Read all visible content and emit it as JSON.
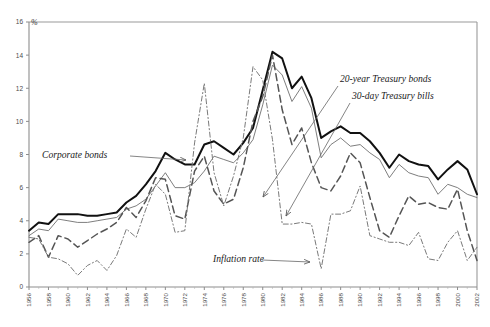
{
  "faint_header": "",
  "axis": {
    "y_unit_label": "%",
    "y_ticks": [
      0,
      2,
      4,
      6,
      8,
      10,
      12,
      14,
      16
    ],
    "x_ticks": [
      1956,
      1958,
      1960,
      1962,
      1964,
      1966,
      1968,
      1970,
      1972,
      1974,
      1976,
      1978,
      1980,
      1982,
      1984,
      1986,
      1988,
      1990,
      1992,
      1994,
      1996,
      1998,
      2000,
      2002
    ]
  },
  "annotations": [
    {
      "name": "corporate-bonds",
      "text": "Corporate bonds",
      "x": 42,
      "y": 158,
      "arrow_from": [
        130,
        156
      ],
      "arrow_to": [
        186,
        160
      ]
    },
    {
      "name": "treasury-bonds-20y",
      "text": "20-year Treasury bonds",
      "x": 340,
      "y": 82,
      "arrow_from": [
        338,
        86
      ],
      "arrow_to": [
        263,
        197
      ]
    },
    {
      "name": "treasury-bills-30d",
      "text": "30-day Treasury bills",
      "x": 352,
      "y": 99,
      "arrow_from": [
        350,
        103
      ],
      "arrow_to": [
        286,
        216
      ]
    },
    {
      "name": "inflation-rate",
      "text": "Inflation rate",
      "x": 213,
      "y": 262,
      "arrow_from": [
        262,
        260
      ],
      "arrow_to": [
        310,
        262
      ]
    }
  ],
  "colors": {
    "corporate_bonds": "#111111",
    "treasury_bonds_20y": "#6f6f6f",
    "treasury_bills_30d": "#555555",
    "inflation_rate": "#7a7a7a",
    "axis": "#9a9a9a",
    "text": "#1a1a1a"
  },
  "chart_data": {
    "type": "line",
    "title": "",
    "xlabel": "",
    "ylabel": "%",
    "xlim": [
      1956,
      2002
    ],
    "ylim": [
      0,
      16
    ],
    "grid": false,
    "legend_position": "inline-annotations",
    "x": [
      1956,
      1957,
      1958,
      1959,
      1960,
      1961,
      1962,
      1963,
      1964,
      1965,
      1966,
      1967,
      1968,
      1969,
      1970,
      1971,
      1972,
      1973,
      1974,
      1975,
      1976,
      1977,
      1978,
      1979,
      1980,
      1981,
      1982,
      1983,
      1984,
      1985,
      1986,
      1987,
      1988,
      1989,
      1990,
      1991,
      1992,
      1993,
      1994,
      1995,
      1996,
      1997,
      1998,
      1999,
      2000,
      2001,
      2002
    ],
    "series": [
      {
        "name": "Corporate bonds",
        "style": "thick-solid",
        "color": "#111111",
        "values": [
          3.4,
          3.9,
          3.8,
          4.4,
          4.4,
          4.4,
          4.3,
          4.3,
          4.4,
          4.5,
          5.1,
          5.5,
          6.2,
          7.0,
          8.1,
          7.7,
          7.4,
          7.4,
          8.6,
          8.8,
          8.4,
          8.0,
          8.7,
          9.6,
          11.9,
          14.2,
          13.8,
          12.0,
          12.7,
          11.4,
          9.0,
          9.4,
          9.7,
          9.3,
          9.3,
          8.8,
          8.1,
          7.2,
          8.0,
          7.6,
          7.4,
          7.3,
          6.5,
          7.1,
          7.6,
          7.1,
          5.6
        ]
      },
      {
        "name": "20-year Treasury bonds",
        "style": "thin-solid",
        "color": "#6f6f6f",
        "values": [
          3.1,
          3.5,
          3.4,
          4.1,
          4.0,
          3.9,
          3.9,
          4.0,
          4.1,
          4.2,
          4.7,
          4.9,
          5.3,
          6.1,
          6.9,
          6.0,
          6.0,
          6.3,
          7.0,
          7.9,
          7.7,
          7.5,
          8.1,
          8.9,
          11.0,
          13.4,
          12.8,
          11.2,
          12.1,
          10.8,
          7.8,
          8.6,
          9.0,
          8.5,
          8.6,
          8.1,
          7.7,
          6.6,
          7.4,
          6.9,
          6.7,
          6.6,
          5.6,
          6.2,
          6.0,
          5.6,
          5.4
        ]
      },
      {
        "name": "30-day Treasury bills",
        "style": "long-dash",
        "color": "#555555",
        "values": [
          2.7,
          3.1,
          1.8,
          3.1,
          2.9,
          2.4,
          2.8,
          3.2,
          3.5,
          3.9,
          4.8,
          4.2,
          5.2,
          6.6,
          6.5,
          4.3,
          4.1,
          7.0,
          7.9,
          5.8,
          5.0,
          5.3,
          7.2,
          10.0,
          11.5,
          14.0,
          10.7,
          8.6,
          9.6,
          7.5,
          6.0,
          5.8,
          6.7,
          8.1,
          7.5,
          5.4,
          3.4,
          3.0,
          4.3,
          5.5,
          5.0,
          5.1,
          4.8,
          4.7,
          5.9,
          3.4,
          1.6
        ]
      },
      {
        "name": "Inflation rate",
        "style": "dash-dot",
        "color": "#7a7a7a",
        "values": [
          3.0,
          2.9,
          1.8,
          1.7,
          1.4,
          0.7,
          1.3,
          1.6,
          1.0,
          1.9,
          3.5,
          3.0,
          4.7,
          6.2,
          5.6,
          3.3,
          3.4,
          8.7,
          12.3,
          6.9,
          4.9,
          6.7,
          9.0,
          13.3,
          12.5,
          8.9,
          3.8,
          3.8,
          3.9,
          3.8,
          1.1,
          4.4,
          4.4,
          4.6,
          6.1,
          3.1,
          2.9,
          2.7,
          2.7,
          2.5,
          3.3,
          1.7,
          1.6,
          2.7,
          3.4,
          1.6,
          2.4
        ]
      }
    ]
  }
}
